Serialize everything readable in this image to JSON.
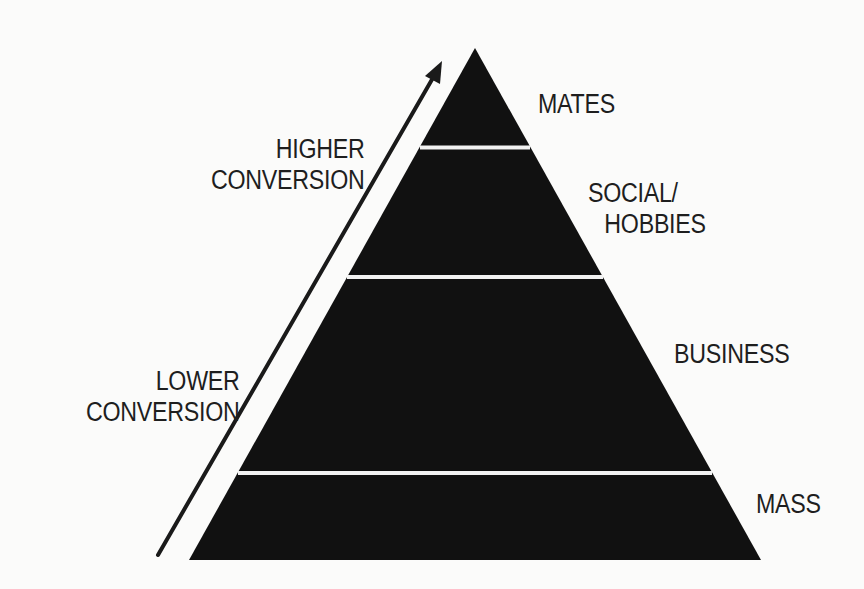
{
  "diagram": {
    "type": "pyramid",
    "colors": {
      "background": "#fbfbfa",
      "pyramid_fill": "#111111",
      "divider": "#f2f2f2",
      "arrow": "#1a1a1a",
      "text": "#1e1e1e"
    },
    "tiers": [
      {
        "order": 1,
        "position": "top",
        "label_lines": [
          "MATES"
        ]
      },
      {
        "order": 2,
        "position": "upper-middle",
        "label_lines": [
          "SOCIAL/",
          "HOBBIES"
        ]
      },
      {
        "order": 3,
        "position": "lower-middle",
        "label_lines": [
          "BUSINESS"
        ]
      },
      {
        "order": 4,
        "position": "bottom",
        "label_lines": [
          "MASS"
        ]
      }
    ],
    "axis_arrow": {
      "direction": "up",
      "top_label_lines": [
        "HIGHER",
        "CONVERSION"
      ],
      "bottom_label_lines": [
        "LOWER",
        "CONVERSION"
      ]
    }
  }
}
